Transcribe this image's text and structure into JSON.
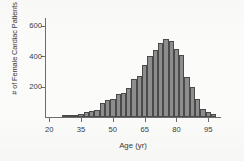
{
  "chart_data": {
    "type": "bar",
    "title": "",
    "xlabel": "Age (yr)",
    "ylabel": "# of Female Cardiac Patients",
    "xlim": [
      18,
      101
    ],
    "ylim": [
      0,
      650
    ],
    "grid": false,
    "legend": null,
    "bin_width": 2.5,
    "xticks": [
      20,
      35,
      50,
      65,
      80,
      95
    ],
    "yticks": [
      200,
      400,
      600
    ],
    "bar_fill": "#8d8d8d",
    "bar_outline": "#4a4a4a",
    "axis_color": "#6d6d6d",
    "categories": [
      "27.5",
      "30.0",
      "32.5",
      "35.0",
      "37.5",
      "40.0",
      "42.5",
      "45.0",
      "47.5",
      "50.0",
      "52.5",
      "55.0",
      "57.5",
      "60.0",
      "62.5",
      "65.0",
      "67.5",
      "70.0",
      "72.5",
      "75.0",
      "77.5",
      "80.0",
      "82.5",
      "85.0",
      "87.5",
      "90.0",
      "92.5",
      "95.0",
      "97.5"
    ],
    "values": [
      8,
      8,
      10,
      18,
      30,
      38,
      45,
      90,
      115,
      120,
      148,
      155,
      190,
      250,
      270,
      340,
      400,
      440,
      485,
      510,
      498,
      445,
      405,
      265,
      195,
      120,
      55,
      30,
      22
    ]
  },
  "axes": {
    "ylabel_text": "# of Female Cardiac Patients",
    "xlabel_text": "Age (yr)",
    "ytick_labels": [
      "200",
      "400",
      "600"
    ],
    "xtick_labels": [
      "20",
      "35",
      "50",
      "65",
      "80",
      "95"
    ]
  }
}
